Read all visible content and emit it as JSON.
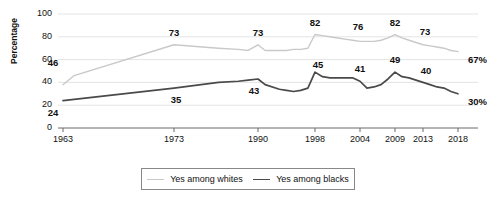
{
  "chart_data": {
    "type": "line",
    "title": "",
    "xlabel": "",
    "ylabel": "Percentage",
    "ylim": [
      0,
      100
    ],
    "yticks": [
      0,
      20,
      40,
      60,
      80,
      100
    ],
    "grid": true,
    "legend_position": "bottom",
    "xticks": [
      1963,
      1973,
      1990,
      1998,
      2004,
      2009,
      2013,
      2018
    ],
    "xtick_labels": [
      "1963",
      "1973",
      "1990",
      "1998",
      "2004",
      "2009",
      "2013",
      "2018"
    ],
    "series": [
      {
        "name": "Yes among whites",
        "color": "#c9c9c9",
        "labelled_points": [
          {
            "x": 1963,
            "y": 46,
            "label": "46"
          },
          {
            "x": 1973,
            "y": 73,
            "label": "73"
          },
          {
            "x": 1990,
            "y": 73,
            "label": "73"
          },
          {
            "x": 1998,
            "y": 82,
            "label": "82"
          },
          {
            "x": 2004,
            "y": 76,
            "label": "76"
          },
          {
            "x": 2009,
            "y": 82,
            "label": "82"
          },
          {
            "x": 2013,
            "y": 73,
            "label": "73"
          },
          {
            "x": 2018,
            "y": 67,
            "label": "67%"
          }
        ],
        "x": [
          1963,
          1964,
          1973,
          1982,
          1986,
          1988,
          1990,
          1991,
          1993,
          1994,
          1995,
          1996,
          1997,
          1998,
          1999,
          2000,
          2001,
          2002,
          2003,
          2004,
          2005,
          2006,
          2007,
          2008,
          2009,
          2010,
          2011,
          2012,
          2013,
          2014,
          2015,
          2016,
          2017,
          2018
        ],
        "y": [
          38,
          46,
          73,
          70,
          69,
          68,
          73,
          68,
          68,
          68,
          69,
          69,
          70,
          82,
          81,
          80,
          79,
          78,
          77,
          76,
          76,
          76,
          77,
          79,
          82,
          79,
          77,
          75,
          73,
          72,
          71,
          70,
          68,
          67
        ]
      },
      {
        "name": "Yes among blacks",
        "color": "#4a4a4a",
        "labelled_points": [
          {
            "x": 1963,
            "y": 24,
            "label": "24"
          },
          {
            "x": 1973,
            "y": 35,
            "label": "35"
          },
          {
            "x": 1990,
            "y": 43,
            "label": "43"
          },
          {
            "x": 1998,
            "y": 45,
            "label": "45"
          },
          {
            "x": 2004,
            "y": 41,
            "label": "41"
          },
          {
            "x": 2009,
            "y": 49,
            "label": "49"
          },
          {
            "x": 2013,
            "y": 40,
            "label": "40"
          },
          {
            "x": 2018,
            "y": 30,
            "label": "30%"
          }
        ],
        "x": [
          1963,
          1973,
          1982,
          1986,
          1988,
          1990,
          1991,
          1993,
          1994,
          1995,
          1996,
          1997,
          1998,
          1999,
          2000,
          2001,
          2002,
          2003,
          2004,
          2005,
          2006,
          2007,
          2008,
          2009,
          2010,
          2011,
          2012,
          2013,
          2014,
          2015,
          2016,
          2017,
          2018
        ],
        "y": [
          24,
          35,
          40,
          41,
          42,
          43,
          38,
          34,
          33,
          32,
          33,
          35,
          49,
          45,
          44,
          44,
          44,
          44,
          41,
          35,
          36,
          38,
          43,
          49,
          45,
          44,
          42,
          40,
          38,
          36,
          35,
          32,
          30
        ]
      }
    ]
  },
  "legend": {
    "items": [
      {
        "label": "Yes among whites"
      },
      {
        "label": "Yes among blacks"
      }
    ]
  }
}
